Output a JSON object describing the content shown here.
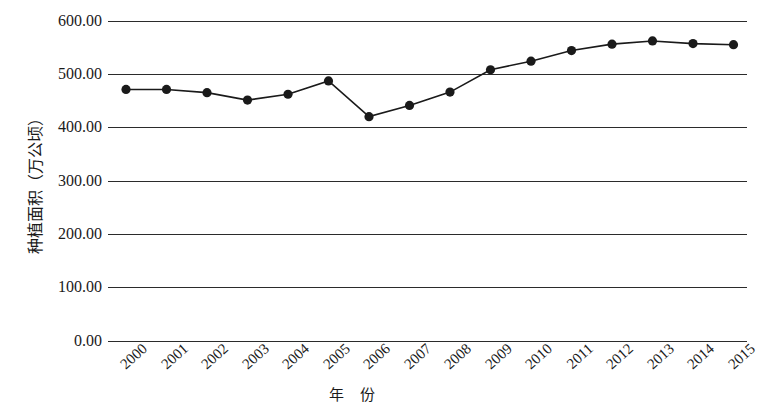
{
  "chart_data": {
    "type": "line",
    "title": "",
    "subtitle": "",
    "xlabel": "年 份",
    "ylabel": "种植面积（万公顷）",
    "categories": [
      "2000",
      "2001",
      "2002",
      "2003",
      "2004",
      "2005",
      "2006",
      "2007",
      "2008",
      "2009",
      "2010",
      "2011",
      "2012",
      "2013",
      "2014",
      "2015"
    ],
    "values": [
      471,
      471,
      465,
      451,
      462,
      487,
      420,
      441,
      466,
      508,
      524,
      544,
      556,
      562,
      557,
      555
    ],
    "series": [
      {
        "name": "种植面积",
        "values": [
          471,
          471,
          465,
          451,
          462,
          487,
          420,
          441,
          466,
          508,
          524,
          544,
          556,
          562,
          557,
          555
        ]
      }
    ],
    "ylim": [
      0,
      600
    ],
    "ytick_labels": [
      "600.00",
      "500.00",
      "400.00",
      "300.00",
      "200.00",
      "100.00",
      "0.00"
    ],
    "ytick_values": [
      600,
      500,
      400,
      300,
      200,
      100,
      0
    ],
    "ytick_interval": 100,
    "grid": "horizontal",
    "legend": "none",
    "marker": "filled-circle",
    "line_color": "#1a1a1a",
    "marker_color": "#1a1a1a",
    "grid_color": "#2b2b2b",
    "background": "#ffffff",
    "xtick_rotation": -42,
    "annotations": []
  }
}
